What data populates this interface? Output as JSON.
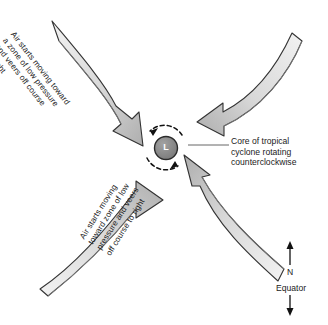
{
  "figure": {
    "background_color": "#ffffff",
    "ink_color": "#1b1b1b",
    "arrow_fill_light": "#ececec",
    "arrow_fill_dark": "#b4b4b4",
    "core_fill": "#8a8a8a"
  },
  "labels": {
    "top_left": "Air starts moving toward\na zone of low pressure\nand veers off course\nto right",
    "bottom_left": "Air starts moving\ntoward zone of low\npressure and veers\noff course to right",
    "callout": "Core of tropical\ncyclone rotating\ncounterclockwise"
  },
  "core": {
    "symbol": "L",
    "meaning": "low pressure center"
  },
  "compass": {
    "north_label": "N",
    "equator_label": "Equator",
    "north_arrow_icon": "arrow-up-icon",
    "equator_arrow_icon": "arrow-down-icon"
  },
  "arrows": [
    {
      "id": "top-left-arrow",
      "from": "upper left",
      "points_to": "core",
      "direction": "down-right then down"
    },
    {
      "id": "top-right-arrow",
      "from": "upper right",
      "points_to": "core",
      "direction": "down-left then left"
    },
    {
      "id": "bottom-left-arrow",
      "from": "lower left",
      "points_to": "core",
      "direction": "up-right then right"
    },
    {
      "id": "bottom-right-arrow",
      "from": "lower right",
      "points_to": "core",
      "direction": "up-left then up"
    }
  ],
  "rotation_arcs": {
    "style": "dashed",
    "sense": "counterclockwise"
  }
}
